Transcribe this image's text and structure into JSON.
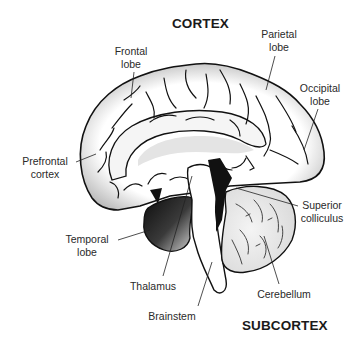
{
  "diagram": {
    "title_top": "CORTEX",
    "title_bottom": "SUBCORTEX",
    "colors": {
      "outline": "#111111",
      "cortex_shade": "#b8b8b8",
      "temporal_dark": "#1a1a1a",
      "cerebellum_fill": "#e6e6e6",
      "background": "#ffffff"
    },
    "labels": {
      "frontal_lobe": {
        "line1": "Frontal",
        "line2": "lobe"
      },
      "parietal_lobe": {
        "line1": "Parietal",
        "line2": "lobe"
      },
      "occipital_lobe": {
        "line1": "Occipital",
        "line2": "lobe"
      },
      "prefrontal_cortex": {
        "line1": "Prefrontal",
        "line2": "cortex"
      },
      "temporal_lobe": {
        "line1": "Temporal",
        "line2": "lobe"
      },
      "thalamus": {
        "line1": "Thalamus"
      },
      "superior_colliculus": {
        "line1": "Superior",
        "line2": "colliculus"
      },
      "cerebellum": {
        "line1": "Cerebellum"
      },
      "brainstem": {
        "line1": "Brainstem"
      }
    }
  }
}
